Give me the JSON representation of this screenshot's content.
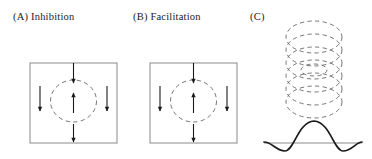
{
  "figure": {
    "background_color": "#ffffff",
    "stroke_color": "#3a3a3a",
    "dash_color": "#555555",
    "curve_color": "#1a1a1a",
    "width": 372,
    "height": 159
  },
  "panels": [
    {
      "id": "A",
      "label": "(A)  Inhibition",
      "label_letter": "(A)",
      "label_text": "Inhibition",
      "box": {
        "x": 30,
        "y": 63,
        "w": 87,
        "h": 80
      },
      "center_field": {
        "shape": "dashed-circle",
        "cx": 73.5,
        "cy": 101,
        "rx": 23,
        "ry": 21
      },
      "arrows": [
        {
          "name": "top-arrow",
          "direction": "down",
          "x": 73.5,
          "y1": 63,
          "y2": 84
        },
        {
          "name": "center-arrow",
          "direction": "up",
          "x": 73.5,
          "y1": 113,
          "y2": 92
        },
        {
          "name": "left-arrow",
          "direction": "down",
          "x": 40,
          "y1": 86,
          "y2": 112
        },
        {
          "name": "right-arrow",
          "direction": "down",
          "x": 107,
          "y1": 86,
          "y2": 112
        },
        {
          "name": "bottom-arrow",
          "direction": "down",
          "x": 73.5,
          "y1": 124,
          "y2": 143
        }
      ]
    },
    {
      "id": "B",
      "label": "(B)  Facilitation",
      "label_letter": "(B)",
      "label_text": "Facilitation",
      "box": {
        "x": 150,
        "y": 63,
        "w": 87,
        "h": 80
      },
      "center_field": {
        "shape": "dashed-circle",
        "cx": 193.5,
        "cy": 101,
        "rx": 23,
        "ry": 21
      },
      "arrows": [
        {
          "name": "top-arrow",
          "direction": "down",
          "x": 193.5,
          "y1": 63,
          "y2": 84
        },
        {
          "name": "center-arrow",
          "direction": "up",
          "x": 193.5,
          "y1": 113,
          "y2": 92
        },
        {
          "name": "left-arrow",
          "direction": "down",
          "x": 160,
          "y1": 86,
          "y2": 112
        },
        {
          "name": "right-arrow",
          "direction": "down",
          "x": 227,
          "y1": 86,
          "y2": 112
        },
        {
          "name": "bottom-arrow",
          "direction": "down",
          "x": 193.5,
          "y1": 124,
          "y2": 143
        }
      ]
    },
    {
      "id": "C",
      "label": "(C)",
      "label_letter": "(C)",
      "label_text": "",
      "ellipse_stack": {
        "count": 6,
        "cx": 314,
        "rx": 28,
        "ry": 16,
        "cy_start": 37,
        "cy_step": 13,
        "style": "dashed"
      },
      "profile_curve": {
        "name": "mexican-hat-profile",
        "baseline_y": 143,
        "baseline_x1": 264,
        "baseline_x2": 362,
        "peak_x": 314,
        "peak_y": 121,
        "trough_left_x": 285,
        "trough_right_x": 343,
        "trough_y": 150
      }
    }
  ]
}
